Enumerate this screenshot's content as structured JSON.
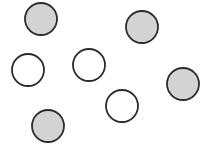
{
  "canvas": {
    "width": 200,
    "height": 149,
    "background": "#ffffff"
  },
  "style": {
    "stroke": "#2b2b2b",
    "gray_fill": "#d3d3d3",
    "white_fill": "#ffffff",
    "radius": 16
  },
  "circles": [
    {
      "id": 1,
      "cx": 41,
      "cy": 19,
      "fill": "gray"
    },
    {
      "id": 2,
      "cx": 142,
      "cy": 27,
      "fill": "gray"
    },
    {
      "id": 3,
      "cx": 28,
      "cy": 70,
      "fill": "white"
    },
    {
      "id": 4,
      "cx": 89,
      "cy": 65,
      "fill": "white"
    },
    {
      "id": 5,
      "cx": 183,
      "cy": 84,
      "fill": "gray"
    },
    {
      "id": 6,
      "cx": 122,
      "cy": 106,
      "fill": "white"
    },
    {
      "id": 7,
      "cx": 48,
      "cy": 126,
      "fill": "gray"
    }
  ],
  "counts": {
    "gray": 4,
    "white": 3,
    "total": 7
  }
}
